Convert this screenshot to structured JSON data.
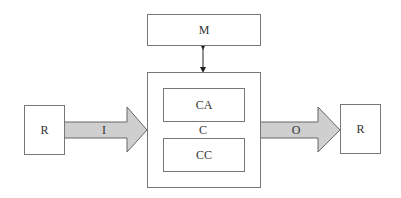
{
  "diagram": {
    "memory": {
      "label": "M"
    },
    "controller": {
      "label": "C",
      "top_block": {
        "label": "CA"
      },
      "bottom_block": {
        "label": "CC"
      }
    },
    "left_node": {
      "label": "R"
    },
    "right_node": {
      "label": "R"
    },
    "input_arrow": {
      "label": "I"
    },
    "output_arrow": {
      "label": "O"
    },
    "colors": {
      "arrow_fill": "#cfcfcf",
      "stroke": "#777777"
    }
  }
}
